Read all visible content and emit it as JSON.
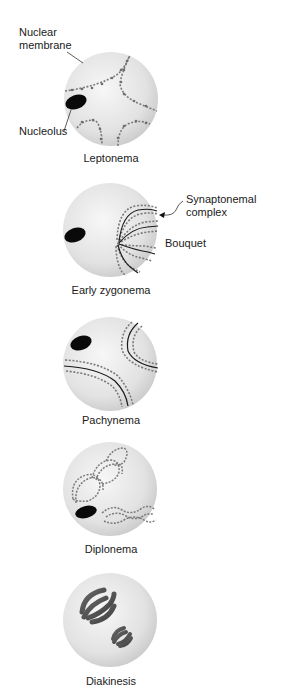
{
  "figure": {
    "annotations": {
      "nuclear_membrane_line1": "Nuclear",
      "nuclear_membrane_line2": "membrane",
      "nucleolus": "Nucleolus",
      "synaptonemal_line1": "Synaptonemal",
      "synaptonemal_line2": "complex",
      "bouquet": "Bouquet"
    },
    "stages": [
      {
        "label": "Leptonema"
      },
      {
        "label": "Early zygonema"
      },
      {
        "label": "Pachynema"
      },
      {
        "label": "Diplonema"
      },
      {
        "label": "Diakinesis"
      }
    ],
    "colors": {
      "nucleus_fill": "#d9d9d9",
      "nucleus_highlight": "#f4f4f4",
      "chromosome": "#7a7a7a",
      "synaptonemal_line": "#1a1a1a",
      "nucleolus": "#0a0a0a",
      "diakinesis_chromosome": "#555555"
    }
  }
}
